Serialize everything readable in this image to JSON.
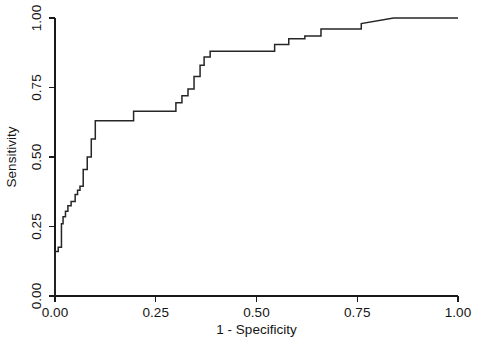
{
  "figure": {
    "title": "",
    "background_color": "#ffffff",
    "line_color": "#262626",
    "axis_color": "#1a1a1a"
  },
  "chart_data": {
    "type": "line",
    "title": "",
    "subtitle": "",
    "xlabel": "1 - Specificity",
    "ylabel": "Sensitivity",
    "xlim": [
      0.0,
      1.0
    ],
    "ylim": [
      0.0,
      1.0
    ],
    "xticks": [
      0.0,
      0.25,
      0.5,
      0.75,
      1.0
    ],
    "xticklabels": [
      "0.00",
      "0.25",
      "0.50",
      "0.75",
      "1.00"
    ],
    "yticks": [
      0.0,
      0.25,
      0.5,
      0.75,
      1.0
    ],
    "yticklabels": [
      "0.00",
      "0.25",
      "0.50",
      "0.75",
      "1.00"
    ],
    "grid": false,
    "legend": null,
    "annotations": [],
    "series": [
      {
        "name": "ROC curve",
        "drawstyle": "steps-post",
        "x": [
          0.0,
          0.0,
          0.008,
          0.008,
          0.016,
          0.016,
          0.02,
          0.02,
          0.026,
          0.026,
          0.032,
          0.032,
          0.04,
          0.04,
          0.05,
          0.05,
          0.056,
          0.056,
          0.062,
          0.062,
          0.07,
          0.07,
          0.08,
          0.08,
          0.09,
          0.09,
          0.1,
          0.1,
          0.195,
          0.195,
          0.3,
          0.3,
          0.315,
          0.315,
          0.33,
          0.33,
          0.345,
          0.345,
          0.36,
          0.36,
          0.37,
          0.37,
          0.385,
          0.385,
          0.4,
          0.4,
          0.545,
          0.545,
          0.58,
          0.58,
          0.62,
          0.62,
          0.66,
          0.66,
          0.76,
          0.76,
          0.84,
          1.0
        ],
        "y": [
          0.0,
          0.16,
          0.16,
          0.175,
          0.175,
          0.26,
          0.26,
          0.285,
          0.285,
          0.305,
          0.305,
          0.325,
          0.325,
          0.34,
          0.34,
          0.365,
          0.365,
          0.38,
          0.38,
          0.395,
          0.395,
          0.455,
          0.455,
          0.5,
          0.5,
          0.565,
          0.565,
          0.63,
          0.63,
          0.665,
          0.665,
          0.695,
          0.695,
          0.72,
          0.72,
          0.745,
          0.745,
          0.79,
          0.79,
          0.83,
          0.83,
          0.86,
          0.86,
          0.88,
          0.88,
          0.88,
          0.88,
          0.905,
          0.905,
          0.925,
          0.925,
          0.935,
          0.935,
          0.96,
          0.96,
          0.98,
          1.0,
          1.0
        ]
      }
    ]
  }
}
